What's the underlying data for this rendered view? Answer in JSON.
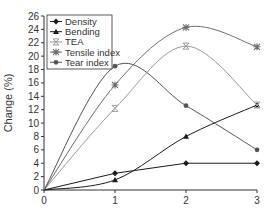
{
  "chart_data": {
    "type": "line",
    "title": "",
    "xlabel": "",
    "ylabel": "Change (%)",
    "x": [
      0,
      1,
      2,
      3
    ],
    "xlim": [
      0,
      3
    ],
    "ylim": [
      0,
      26
    ],
    "xticks": [
      0,
      1,
      2,
      3
    ],
    "yticks": [
      0,
      2,
      4,
      6,
      8,
      10,
      12,
      14,
      16,
      18,
      20,
      22,
      24,
      26
    ],
    "grid": false,
    "legend_position": "upper left",
    "series": [
      {
        "name": "Density",
        "marker": "diamond",
        "color": "#1a1a1a",
        "smooth": false,
        "values": [
          0,
          2.5,
          4.0,
          4.0
        ]
      },
      {
        "name": "Bending",
        "marker": "triangle",
        "color": "#1a1a1a",
        "smooth": true,
        "values": [
          0,
          1.5,
          8.0,
          12.7
        ]
      },
      {
        "name": "TEA",
        "marker": "x-bar",
        "color": "#9a9a9a",
        "smooth": true,
        "values": [
          0,
          12.2,
          21.5,
          12.7
        ]
      },
      {
        "name": "Tensile index",
        "marker": "asterisk",
        "color": "#6e6e6e",
        "smooth": true,
        "values": [
          0,
          15.7,
          24.3,
          21.4
        ]
      },
      {
        "name": "Tear index",
        "marker": "circle",
        "color": "#555555",
        "smooth": true,
        "values": [
          0,
          18.5,
          12.6,
          6.0
        ]
      }
    ]
  }
}
